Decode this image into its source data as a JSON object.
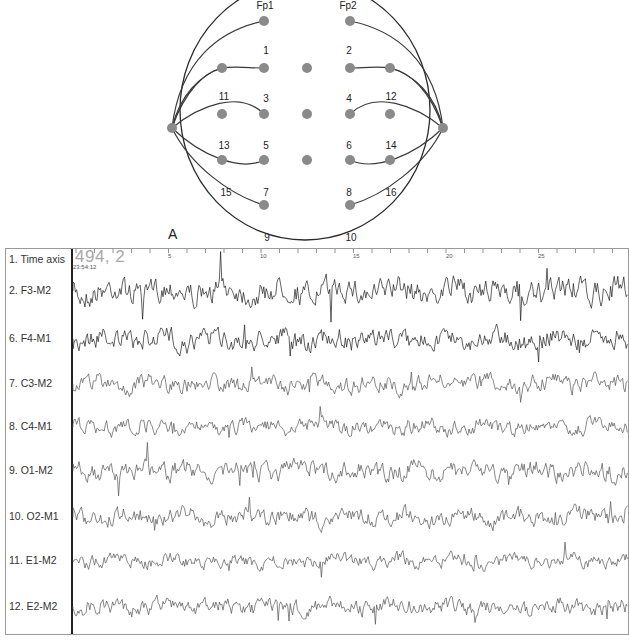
{
  "figure": {
    "panel_label": "A"
  },
  "montage": {
    "frontal_electrodes": [
      "Fp1",
      "Fp2"
    ],
    "electrode_numbers": [
      "1",
      "2",
      "3",
      "4",
      "5",
      "6",
      "7",
      "8",
      "9",
      "10",
      "11",
      "12",
      "13",
      "14",
      "15",
      "16"
    ],
    "colors": {
      "electrode": "#8a8a8a",
      "line": "#3a3a3a"
    }
  },
  "eeg": {
    "time_axis": {
      "label": "1. Time axis",
      "position_display": "494, 2",
      "clock_time": "23:54:12",
      "ticks": [
        "5",
        "10",
        "15",
        "20",
        "25"
      ]
    },
    "channels": [
      {
        "label": "2. F3-M2"
      },
      {
        "label": "6. F4-M1"
      },
      {
        "label": "7. C3-M2"
      },
      {
        "label": "8. C4-M1"
      },
      {
        "label": "9. O1-M2"
      },
      {
        "label": "10. O2-M1"
      },
      {
        "label": "11. E1-M2"
      },
      {
        "label": "12. E2-M2"
      }
    ],
    "colors": {
      "trace_dark": "#1e1e1e",
      "trace_gray": "#555555",
      "border": "#9a9a9a"
    }
  }
}
